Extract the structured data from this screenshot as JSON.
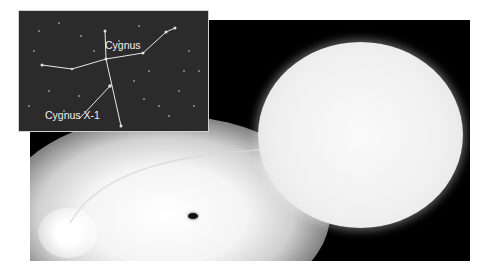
{
  "inset": {
    "constellation_label": "Cygnus",
    "target_label": "Cygnus X-1"
  },
  "scene": {
    "companion_star": "blue supergiant",
    "object": "black hole with accretion disk"
  }
}
